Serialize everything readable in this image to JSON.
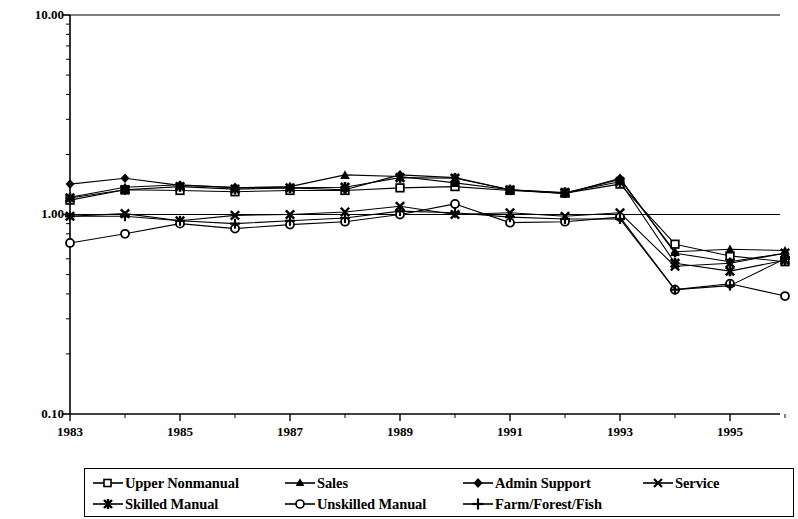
{
  "chart_data": {
    "type": "line",
    "title": "",
    "subtitle": "",
    "xlabel": "",
    "ylabel": "",
    "yscale": "log",
    "ylim": [
      0.1,
      10.0
    ],
    "ytick_labels": [
      "10.00",
      "1.00",
      "0.10"
    ],
    "ytick_values": [
      10.0,
      1.0,
      0.1
    ],
    "grid": false,
    "reference_line": 1.0,
    "legend_position": "bottom",
    "x": [
      1983,
      1984,
      1985,
      1986,
      1987,
      1988,
      1989,
      1990,
      1991,
      1992,
      1993,
      1994,
      1995,
      1996
    ],
    "xtick_labels": [
      "1983",
      "",
      "1985",
      "",
      "1987",
      "",
      "1989",
      "",
      "1991",
      "",
      "1993",
      "",
      "1995",
      ""
    ],
    "xtick_labels_visible": [
      "1983",
      "1985",
      "1987",
      "1989",
      "1991",
      "1993",
      "1995"
    ],
    "series": [
      {
        "name": "Upper Nonmanual",
        "marker": "open-square",
        "values": [
          1.18,
          1.33,
          1.32,
          1.3,
          1.32,
          1.32,
          1.36,
          1.38,
          1.32,
          1.28,
          1.42,
          0.71,
          0.62,
          0.58
        ]
      },
      {
        "name": "Sales",
        "marker": "filled-triangle",
        "values": [
          1.22,
          1.37,
          1.41,
          1.36,
          1.38,
          1.58,
          1.55,
          1.44,
          1.33,
          1.28,
          1.5,
          0.65,
          0.67,
          0.66
        ]
      },
      {
        "name": "Admin Support",
        "marker": "filled-diamond",
        "values": [
          1.42,
          1.52,
          1.4,
          1.37,
          1.36,
          1.33,
          1.58,
          1.53,
          1.33,
          1.27,
          1.52,
          0.64,
          0.58,
          0.64
        ]
      },
      {
        "name": "Service",
        "marker": "cross-x",
        "values": [
          0.98,
          1.01,
          0.93,
          0.99,
          1.0,
          1.03,
          1.1,
          1.0,
          1.02,
          0.98,
          1.02,
          0.55,
          0.57,
          0.64
        ]
      },
      {
        "name": "Skilled Manual",
        "marker": "filled-star",
        "values": [
          1.21,
          1.33,
          1.38,
          1.34,
          1.36,
          1.37,
          1.53,
          1.52,
          1.33,
          1.29,
          1.46,
          0.57,
          0.52,
          0.59
        ]
      },
      {
        "name": "Unskilled Manual",
        "marker": "open-circle",
        "values": [
          0.72,
          0.8,
          0.9,
          0.85,
          0.89,
          0.92,
          1.0,
          1.13,
          0.91,
          0.92,
          0.97,
          0.42,
          0.45,
          0.39
        ]
      },
      {
        "name": "Farm/Forest/Fish",
        "marker": "plus",
        "values": [
          0.98,
          0.98,
          0.93,
          0.9,
          0.93,
          0.96,
          1.04,
          1.02,
          0.97,
          0.95,
          0.95,
          0.42,
          0.44,
          0.6
        ]
      }
    ]
  },
  "axes": {
    "y_labels": [
      "10.00",
      "1.00",
      "0.10"
    ],
    "x_labels": [
      "1983",
      "1985",
      "1987",
      "1989",
      "1991",
      "1993",
      "1995"
    ]
  },
  "legend": {
    "row1": [
      {
        "label": "Upper Nonmanual",
        "marker": "open-square"
      },
      {
        "label": "Sales",
        "marker": "filled-triangle"
      },
      {
        "label": "Admin Support",
        "marker": "filled-diamond"
      },
      {
        "label": "Service",
        "marker": "cross-x"
      }
    ],
    "row2": [
      {
        "label": "Skilled Manual",
        "marker": "filled-star"
      },
      {
        "label": "Unskilled Manual",
        "marker": "open-circle"
      },
      {
        "label": "Farm/Forest/Fish",
        "marker": "plus"
      }
    ]
  },
  "colors": {
    "line": "#000000",
    "axis": "#000000",
    "background": "#ffffff"
  }
}
